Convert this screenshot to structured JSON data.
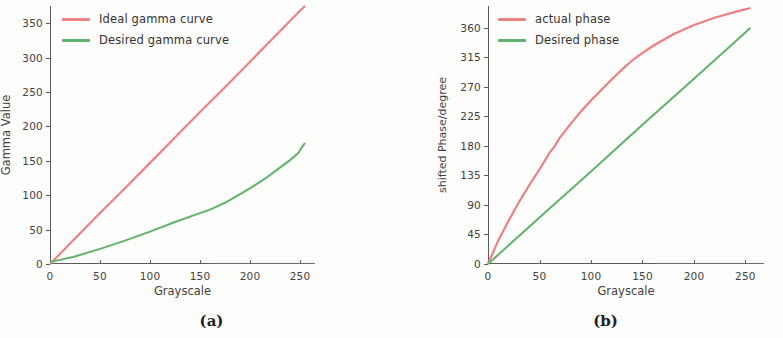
{
  "figure": {
    "background": "#fdfdfb",
    "colors": {
      "red": "#ee7f83",
      "green": "#5fb36a",
      "axis": "#5a5a5a",
      "text": "#3a3a3a"
    }
  },
  "panels": [
    {
      "caption": "(a)",
      "chart_data": {
        "type": "line",
        "title": "",
        "xlabel": "Grayscale",
        "ylabel": "Gamma Value",
        "xlim": [
          0,
          265
        ],
        "ylim": [
          0,
          375
        ],
        "xticks": [
          0,
          50,
          100,
          150,
          200,
          250
        ],
        "yticks": [
          0,
          50,
          100,
          150,
          200,
          250,
          300,
          350
        ],
        "grid": false,
        "legend_position": "upper-left",
        "series": [
          {
            "name": "Ideal gamma curve",
            "color": "#ee7f83",
            "x": [
              0,
              25,
              50,
              75,
              100,
              125,
              150,
              175,
              200,
              225,
              250,
              255
            ],
            "values": [
              0,
              37,
              74,
              110,
              147,
              184,
              221,
              257,
              294,
              331,
              368,
              375
            ]
          },
          {
            "name": "Desired gamma curve",
            "color": "#5fb36a",
            "x": [
              0,
              10,
              25,
              50,
              75,
              100,
              125,
              150,
              160,
              175,
              200,
              215,
              230,
              240,
              248,
              252,
              255
            ],
            "values": [
              3,
              6,
              11,
              22,
              34,
              47,
              61,
              74,
              79,
              89,
              110,
              124,
              140,
              151,
              161,
              170,
              176
            ]
          }
        ]
      }
    },
    {
      "caption": "(b)",
      "chart_data": {
        "type": "line",
        "title": "",
        "xlabel": "Grayscale",
        "ylabel": "shifted Phase/degree",
        "xlim": [
          0,
          268
        ],
        "ylim": [
          0,
          393
        ],
        "xticks": [
          0,
          50,
          100,
          150,
          200,
          250
        ],
        "yticks": [
          0,
          45,
          90,
          135,
          180,
          225,
          270,
          315,
          360
        ],
        "grid": false,
        "legend_position": "upper-left",
        "series": [
          {
            "name": "actual phase",
            "color": "#ee7f83",
            "x": [
              0,
              10,
              20,
              30,
              40,
              50,
              60,
              65,
              70,
              80,
              90,
              100,
              110,
              120,
              130,
              140,
              145,
              160,
              180,
              200,
              220,
              240,
              255
            ],
            "values": [
              0,
              36,
              66,
              94,
              120,
              144,
              170,
              180,
              193,
              213,
              232,
              249,
              265,
              281,
              296,
              310,
              316,
              332,
              350,
              364,
              375,
              384,
              390
            ]
          },
          {
            "name": "Desired phase",
            "color": "#5fb36a",
            "x": [
              0,
              50,
              100,
              150,
              200,
              255
            ],
            "values": [
              0,
              71,
              141,
              212,
              282,
              360
            ]
          }
        ]
      }
    }
  ]
}
